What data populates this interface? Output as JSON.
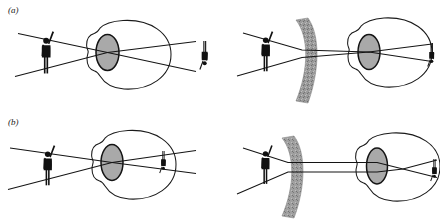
{
  "figure": {
    "kind": "optics-diagram",
    "background_color": "#ffffff",
    "ink_color": "#1a1a1a",
    "lens_fill_color": "#a9a9a9",
    "corrective_lens_fill_color": "#999999",
    "panels": [
      {
        "id": "a",
        "label": "(a)",
        "row": "top",
        "cells": [
          {
            "id": "a-left",
            "name": "uncorrected-eye",
            "object": "person-silhouette-arm-raised",
            "corrective_lens": null,
            "image": "inverted-person-on-retina",
            "focus": "on-retina"
          },
          {
            "id": "a-right",
            "name": "corrected-eye",
            "object": "person-silhouette-arm-raised",
            "corrective_lens": "concave-diverging-lens",
            "image": "inverted-person-on-retina",
            "focus": "on-retina"
          }
        ]
      },
      {
        "id": "b",
        "label": "(b)",
        "row": "bottom",
        "cells": [
          {
            "id": "b-left",
            "name": "uncorrected-eye",
            "object": "person-silhouette-arm-raised",
            "corrective_lens": null,
            "image": "inverted-person-on-retina",
            "focus": "on-retina"
          },
          {
            "id": "b-right",
            "name": "corrected-eye",
            "object": "person-silhouette-arm-raised",
            "corrective_lens": "concave-diverging-lens",
            "image": "inverted-person-on-retina",
            "focus": "in-front-of-retina"
          }
        ]
      }
    ]
  }
}
